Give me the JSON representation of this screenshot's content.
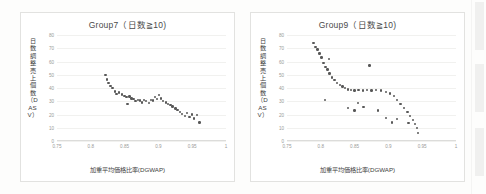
{
  "page": {
    "background_color": "#fdfdfc",
    "chart_frame_color": "#e2e2e0"
  },
  "charts": [
    {
      "id": "group7",
      "title": "Group7（日数≧10)",
      "ylabel": "日数調整売上個数（DASV）",
      "xlabel": "加重平均価格比率(DGWAP)",
      "xticks": [
        "0.75",
        "0.8",
        "0.85",
        "0.9",
        "0.95",
        "1"
      ],
      "yticks": [
        "0",
        "10",
        "20",
        "30",
        "40",
        "50",
        "60",
        "70",
        "80"
      ]
    },
    {
      "id": "group9",
      "title": "Group9（日数≧10)",
      "ylabel": "日数調整売上個数（DASV）",
      "xlabel": "加重平均価格比率(DGWAP)",
      "xticks": [
        "0.75",
        "0.8",
        "0.85",
        "0.9",
        "0.95",
        "1"
      ],
      "yticks": [
        "0",
        "10",
        "20",
        "30",
        "40",
        "50",
        "60",
        "70",
        "80"
      ]
    }
  ],
  "chart_data": [
    {
      "type": "scatter",
      "id": "group7",
      "title": "Group7（日数≧10)",
      "xlabel": "加重平均価格比率(DGWAP)",
      "ylabel": "日数調整売上個数（DASV）",
      "xlim": [
        0.75,
        1.0
      ],
      "ylim": [
        0,
        80
      ],
      "grid": true,
      "legend": "none",
      "xticks": [
        0.75,
        0.8,
        0.85,
        0.9,
        0.95,
        1.0
      ],
      "yticks": [
        0,
        10,
        20,
        30,
        40,
        50,
        60,
        70,
        80
      ],
      "points": [
        {
          "x": 0.822,
          "y": 50.0
        },
        {
          "x": 0.824,
          "y": 46.5
        },
        {
          "x": 0.826,
          "y": 44.0
        },
        {
          "x": 0.829,
          "y": 41.5
        },
        {
          "x": 0.832,
          "y": 40.0
        },
        {
          "x": 0.836,
          "y": 37.5
        },
        {
          "x": 0.838,
          "y": 35.5
        },
        {
          "x": 0.842,
          "y": 36.5
        },
        {
          "x": 0.846,
          "y": 35.0
        },
        {
          "x": 0.85,
          "y": 34.0
        },
        {
          "x": 0.853,
          "y": 33.0
        },
        {
          "x": 0.857,
          "y": 33.5
        },
        {
          "x": 0.86,
          "y": 32.0
        },
        {
          "x": 0.863,
          "y": 31.5
        },
        {
          "x": 0.866,
          "y": 30.0
        },
        {
          "x": 0.854,
          "y": 28.0
        },
        {
          "x": 0.87,
          "y": 31.0
        },
        {
          "x": 0.873,
          "y": 30.5
        },
        {
          "x": 0.876,
          "y": 29.0
        },
        {
          "x": 0.879,
          "y": 31.0
        },
        {
          "x": 0.882,
          "y": 30.0
        },
        {
          "x": 0.886,
          "y": 28.5
        },
        {
          "x": 0.889,
          "y": 31.0
        },
        {
          "x": 0.892,
          "y": 30.5
        },
        {
          "x": 0.895,
          "y": 33.0
        },
        {
          "x": 0.898,
          "y": 31.5
        },
        {
          "x": 0.901,
          "y": 34.5
        },
        {
          "x": 0.904,
          "y": 32.0
        },
        {
          "x": 0.907,
          "y": 30.0
        },
        {
          "x": 0.911,
          "y": 29.0
        },
        {
          "x": 0.914,
          "y": 28.0
        },
        {
          "x": 0.918,
          "y": 27.0
        },
        {
          "x": 0.921,
          "y": 26.0
        },
        {
          "x": 0.925,
          "y": 24.5
        },
        {
          "x": 0.928,
          "y": 23.5
        },
        {
          "x": 0.932,
          "y": 22.0
        },
        {
          "x": 0.935,
          "y": 20.5
        },
        {
          "x": 0.939,
          "y": 19.0
        },
        {
          "x": 0.942,
          "y": 21.0
        },
        {
          "x": 0.946,
          "y": 18.0
        },
        {
          "x": 0.95,
          "y": 20.0
        },
        {
          "x": 0.953,
          "y": 17.0
        },
        {
          "x": 0.957,
          "y": 19.5
        },
        {
          "x": 0.961,
          "y": 14.0
        }
      ]
    },
    {
      "type": "scatter",
      "id": "group9",
      "title": "Group9（日数≧10)",
      "xlabel": "加重平均価格比率(DGWAP)",
      "ylabel": "日数調整売上個数（DASV）",
      "xlim": [
        0.75,
        1.0
      ],
      "ylim": [
        0,
        80
      ],
      "grid": true,
      "legend": "none",
      "xticks": [
        0.75,
        0.8,
        0.85,
        0.9,
        0.95,
        1.0
      ],
      "yticks": [
        0,
        10,
        20,
        30,
        40,
        50,
        60,
        70,
        80
      ],
      "points": [
        {
          "x": 0.789,
          "y": 74.0
        },
        {
          "x": 0.792,
          "y": 71.0
        },
        {
          "x": 0.795,
          "y": 69.0
        },
        {
          "x": 0.798,
          "y": 66.0
        },
        {
          "x": 0.801,
          "y": 63.0
        },
        {
          "x": 0.804,
          "y": 59.0
        },
        {
          "x": 0.807,
          "y": 56.0
        },
        {
          "x": 0.81,
          "y": 54.0
        },
        {
          "x": 0.813,
          "y": 51.0
        },
        {
          "x": 0.817,
          "y": 48.0
        },
        {
          "x": 0.82,
          "y": 46.0
        },
        {
          "x": 0.824,
          "y": 44.0
        },
        {
          "x": 0.828,
          "y": 42.5
        },
        {
          "x": 0.832,
          "y": 41.0
        },
        {
          "x": 0.836,
          "y": 40.0
        },
        {
          "x": 0.84,
          "y": 39.0
        },
        {
          "x": 0.845,
          "y": 38.5
        },
        {
          "x": 0.85,
          "y": 38.0
        },
        {
          "x": 0.856,
          "y": 38.5
        },
        {
          "x": 0.862,
          "y": 38.0
        },
        {
          "x": 0.868,
          "y": 38.5
        },
        {
          "x": 0.875,
          "y": 38.0
        },
        {
          "x": 0.882,
          "y": 38.5
        },
        {
          "x": 0.889,
          "y": 38.0
        },
        {
          "x": 0.896,
          "y": 37.0
        },
        {
          "x": 0.902,
          "y": 36.0
        },
        {
          "x": 0.908,
          "y": 34.0
        },
        {
          "x": 0.913,
          "y": 31.0
        },
        {
          "x": 0.918,
          "y": 28.0
        },
        {
          "x": 0.923,
          "y": 25.0
        },
        {
          "x": 0.928,
          "y": 22.0
        },
        {
          "x": 0.932,
          "y": 19.0
        },
        {
          "x": 0.936,
          "y": 16.0
        },
        {
          "x": 0.939,
          "y": 13.0
        },
        {
          "x": 0.942,
          "y": 10.0
        },
        {
          "x": 0.944,
          "y": 6.0
        },
        {
          "x": 0.812,
          "y": 62.0
        },
        {
          "x": 0.872,
          "y": 57.0
        },
        {
          "x": 0.806,
          "y": 31.0
        },
        {
          "x": 0.84,
          "y": 25.0
        },
        {
          "x": 0.855,
          "y": 28.5
        },
        {
          "x": 0.85,
          "y": 23.0
        },
        {
          "x": 0.863,
          "y": 25.5
        },
        {
          "x": 0.885,
          "y": 23.0
        },
        {
          "x": 0.896,
          "y": 17.5
        },
        {
          "x": 0.905,
          "y": 14.0
        },
        {
          "x": 0.913,
          "y": 16.5
        },
        {
          "x": 0.93,
          "y": 13.5
        }
      ]
    }
  ]
}
